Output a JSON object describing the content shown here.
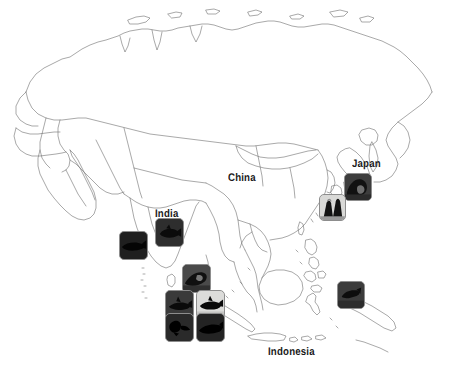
{
  "map": {
    "title": "Asia outline map with photo observation markers",
    "background_color": "#ffffff",
    "outline_color": "#6e6e6e",
    "outline_width": 0.6,
    "region": "Asia / Indian Ocean / Western Pacific"
  },
  "labels": [
    {
      "name": "china",
      "text": "China",
      "x": 228,
      "y": 172,
      "font_size": 11
    },
    {
      "name": "japan",
      "text": "Japan",
      "x": 352,
      "y": 158,
      "font_size": 11
    },
    {
      "name": "india",
      "text": "India",
      "x": 155,
      "y": 208,
      "font_size": 11
    },
    {
      "name": "indonesia",
      "text": "Indonesia",
      "x": 268,
      "y": 346,
      "font_size": 11
    }
  ],
  "markers": [
    {
      "name": "marker-japan-wave",
      "x": 344,
      "y": 173,
      "size": 28,
      "style": "dark",
      "subject": "wave-silhouette",
      "label": "Japan"
    },
    {
      "name": "marker-japan-volcano",
      "x": 319,
      "y": 194,
      "size": 27,
      "style": "light",
      "subject": "volcano-silhouette",
      "label": "Japan"
    },
    {
      "name": "marker-india-north",
      "x": 155,
      "y": 218,
      "size": 29,
      "style": "dark",
      "subject": "fish-silhouette",
      "label": "India"
    },
    {
      "name": "marker-arabian-sea",
      "x": 119,
      "y": 231,
      "size": 29,
      "style": "dark",
      "subject": "whale-silhouette",
      "label": "Arabian Sea"
    },
    {
      "name": "marker-andaman",
      "x": 182,
      "y": 264,
      "size": 29,
      "style": "dark",
      "subject": "ray-silhouette",
      "label": "Andaman Sea"
    },
    {
      "name": "marker-sumatra-west",
      "x": 165,
      "y": 290,
      "size": 29,
      "style": "dark",
      "subject": "shark-silhouette",
      "label": "Sumatra"
    },
    {
      "name": "marker-sumatra-east",
      "x": 196,
      "y": 290,
      "size": 29,
      "style": "light",
      "subject": "shark-silhouette",
      "label": "Sumatra"
    },
    {
      "name": "marker-java-west",
      "x": 165,
      "y": 313,
      "size": 29,
      "style": "dark",
      "subject": "turtle-silhouette",
      "label": "Java"
    },
    {
      "name": "marker-java-east",
      "x": 196,
      "y": 313,
      "size": 29,
      "style": "dark",
      "subject": "manta-silhouette",
      "label": "Java"
    },
    {
      "name": "marker-papua",
      "x": 337,
      "y": 281,
      "size": 28,
      "style": "dark",
      "subject": "coral-silhouette",
      "label": "Papua"
    }
  ]
}
